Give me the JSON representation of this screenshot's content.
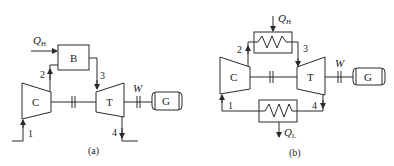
{
  "diagram": {
    "panels": [
      {
        "id": "a",
        "caption": "(a)",
        "components": {
          "compressor": "C",
          "burner": "B",
          "turbine": "T",
          "generator": "G"
        },
        "heat_in": {
          "symbol": "Q",
          "subscript": "H"
        },
        "work": "W",
        "states": [
          "1",
          "2",
          "3",
          "4"
        ]
      },
      {
        "id": "b",
        "caption": "(b)",
        "components": {
          "compressor": "C",
          "turbine": "T",
          "generator": "G"
        },
        "heat_in": {
          "symbol": "Q",
          "subscript": "H"
        },
        "heat_out": {
          "symbol": "Q",
          "subscript": "L"
        },
        "work": "W",
        "states": [
          "1",
          "2",
          "3",
          "4"
        ]
      }
    ]
  }
}
